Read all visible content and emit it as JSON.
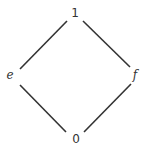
{
  "diagram": {
    "type": "hasse-diagram",
    "nodes": [
      {
        "id": "top",
        "label": "1",
        "x": 75,
        "y": 17
      },
      {
        "id": "left",
        "label": "e",
        "x": 10,
        "y": 79
      },
      {
        "id": "right",
        "label": "f",
        "x": 135,
        "y": 79
      },
      {
        "id": "bottom",
        "label": "0",
        "x": 76,
        "y": 143
      }
    ],
    "edges": [
      {
        "from": "1",
        "to": "e"
      },
      {
        "from": "1",
        "to": "f"
      },
      {
        "from": "e",
        "to": "0"
      },
      {
        "from": "f",
        "to": "0"
      }
    ],
    "colors": {
      "line": "#333333",
      "text": "#333333",
      "background": "#ffffff"
    }
  }
}
